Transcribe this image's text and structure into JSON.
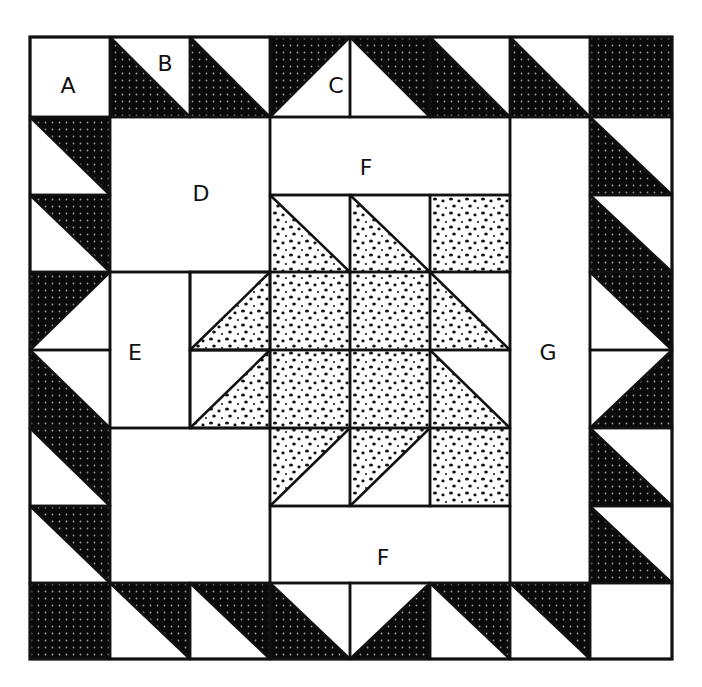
{
  "diagram": {
    "type": "quilt-block",
    "grid": {
      "cols": 8,
      "rows": 8,
      "x": [
        30,
        110,
        190,
        270,
        350,
        430,
        510,
        590,
        672
      ],
      "y": [
        37,
        117,
        195,
        272,
        350,
        428,
        506,
        583,
        659
      ]
    },
    "colors": {
      "dark": "#0a0a0a",
      "dark_dot": "#9a9a9a",
      "light": "#ffffff",
      "light_dot": "#111111",
      "line": "#111111"
    },
    "border_cells": [
      {
        "c": 0,
        "r": 0,
        "t": "plain"
      },
      {
        "c": 1,
        "r": 0,
        "t": "hst",
        "d": "bl",
        "f": "dark"
      },
      {
        "c": 2,
        "r": 0,
        "t": "hst",
        "d": "bl",
        "f": "dark"
      },
      {
        "c": 3,
        "r": 0,
        "t": "hst",
        "d": "tl",
        "f": "dark"
      },
      {
        "c": 4,
        "r": 0,
        "t": "hst",
        "d": "tr",
        "f": "dark"
      },
      {
        "c": 5,
        "r": 0,
        "t": "hst",
        "d": "bl",
        "f": "dark"
      },
      {
        "c": 6,
        "r": 0,
        "t": "hst",
        "d": "bl",
        "f": "dark"
      },
      {
        "c": 7,
        "r": 0,
        "t": "solid",
        "f": "dark"
      },
      {
        "c": 0,
        "r": 1,
        "t": "hst",
        "d": "tr",
        "f": "dark"
      },
      {
        "c": 0,
        "r": 2,
        "t": "hst",
        "d": "tr",
        "f": "dark"
      },
      {
        "c": 0,
        "r": 3,
        "t": "hst",
        "d": "tl",
        "f": "dark"
      },
      {
        "c": 0,
        "r": 4,
        "t": "hst",
        "d": "bl",
        "f": "dark"
      },
      {
        "c": 0,
        "r": 5,
        "t": "hst",
        "d": "tr",
        "f": "dark"
      },
      {
        "c": 0,
        "r": 6,
        "t": "hst",
        "d": "tr",
        "f": "dark"
      },
      {
        "c": 0,
        "r": 7,
        "t": "solid",
        "f": "dark"
      },
      {
        "c": 7,
        "r": 1,
        "t": "hst",
        "d": "bl",
        "f": "dark"
      },
      {
        "c": 7,
        "r": 2,
        "t": "hst",
        "d": "bl",
        "f": "dark"
      },
      {
        "c": 7,
        "r": 3,
        "t": "hst",
        "d": "tr",
        "f": "dark"
      },
      {
        "c": 7,
        "r": 4,
        "t": "hst",
        "d": "br",
        "f": "dark"
      },
      {
        "c": 7,
        "r": 5,
        "t": "hst",
        "d": "bl",
        "f": "dark"
      },
      {
        "c": 7,
        "r": 6,
        "t": "hst",
        "d": "bl",
        "f": "dark"
      },
      {
        "c": 7,
        "r": 7,
        "t": "plain"
      },
      {
        "c": 1,
        "r": 7,
        "t": "hst",
        "d": "tr",
        "f": "dark"
      },
      {
        "c": 2,
        "r": 7,
        "t": "hst",
        "d": "tr",
        "f": "dark"
      },
      {
        "c": 3,
        "r": 7,
        "t": "hst",
        "d": "bl",
        "f": "dark"
      },
      {
        "c": 4,
        "r": 7,
        "t": "hst",
        "d": "br",
        "f": "dark"
      },
      {
        "c": 5,
        "r": 7,
        "t": "hst",
        "d": "tr",
        "f": "dark"
      },
      {
        "c": 6,
        "r": 7,
        "t": "hst",
        "d": "tr",
        "f": "dark"
      }
    ],
    "center_cells": [
      {
        "c": 2,
        "r": 3,
        "t": "hst",
        "d": "br",
        "f": "light"
      },
      {
        "c": 2,
        "r": 4,
        "t": "hst",
        "d": "br",
        "f": "light"
      },
      {
        "c": 3,
        "r": 2,
        "t": "hst",
        "d": "bl",
        "f": "light"
      },
      {
        "c": 4,
        "r": 2,
        "t": "hst",
        "d": "bl",
        "f": "light"
      },
      {
        "c": 5,
        "r": 2,
        "t": "solid",
        "f": "light"
      },
      {
        "c": 3,
        "r": 3,
        "t": "solid",
        "f": "light"
      },
      {
        "c": 4,
        "r": 3,
        "t": "solid",
        "f": "light"
      },
      {
        "c": 5,
        "r": 3,
        "t": "hst",
        "d": "bl",
        "f": "light"
      },
      {
        "c": 3,
        "r": 4,
        "t": "solid",
        "f": "light"
      },
      {
        "c": 4,
        "r": 4,
        "t": "solid",
        "f": "light"
      },
      {
        "c": 5,
        "r": 4,
        "t": "hst",
        "d": "bl",
        "f": "light"
      },
      {
        "c": 3,
        "r": 5,
        "t": "hst",
        "d": "tl",
        "f": "light"
      },
      {
        "c": 4,
        "r": 5,
        "t": "hst",
        "d": "tl",
        "f": "light"
      },
      {
        "c": 5,
        "r": 5,
        "t": "solid",
        "f": "light"
      }
    ],
    "rects": [
      {
        "name": "piece-d",
        "c0": 1,
        "r0": 1,
        "c1": 3,
        "r1": 3
      },
      {
        "name": "piece-f-top",
        "c0": 3,
        "r0": 1,
        "c1": 6,
        "r1": 2
      },
      {
        "name": "piece-g",
        "c0": 6,
        "r0": 1,
        "c1": 7,
        "r1": 7
      },
      {
        "name": "piece-e",
        "c0": 1,
        "r0": 3,
        "c1": 2,
        "r1": 5
      },
      {
        "name": "piece-plain-square",
        "c0": 1,
        "r0": 5,
        "c1": 3,
        "r1": 7
      },
      {
        "name": "piece-f-bottom",
        "c0": 3,
        "r0": 6,
        "c1": 6,
        "r1": 7
      },
      {
        "name": "cell-2-3",
        "c0": 2,
        "r0": 3,
        "c1": 3,
        "r1": 4
      },
      {
        "name": "cell-2-4",
        "c0": 2,
        "r0": 4,
        "c1": 3,
        "r1": 5
      }
    ],
    "labels": [
      {
        "text": "A",
        "x": 68,
        "y": 93
      },
      {
        "text": "B",
        "x": 165,
        "y": 71
      },
      {
        "text": "C",
        "x": 336,
        "y": 93
      },
      {
        "text": "D",
        "x": 201,
        "y": 201
      },
      {
        "text": "E",
        "x": 135,
        "y": 360
      },
      {
        "text": "F",
        "x": 366,
        "y": 175
      },
      {
        "text": "G",
        "x": 548,
        "y": 360
      },
      {
        "text": "F",
        "x": 383,
        "y": 565
      }
    ]
  }
}
